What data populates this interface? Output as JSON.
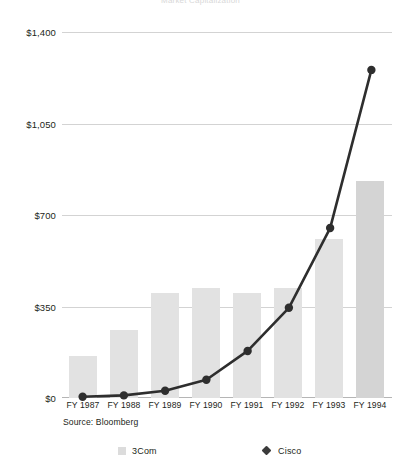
{
  "chart_data": {
    "type": "bar",
    "title": "Market Capitalization",
    "subtitle": "",
    "xlabel": "",
    "ylabel": "",
    "ylim": [
      0,
      1400
    ],
    "yticks": [
      0,
      350,
      700,
      1050,
      1400
    ],
    "ytick_labels": [
      "$0",
      "$350",
      "$700",
      "$1,050",
      "$1,400"
    ],
    "grid": true,
    "legend_position": "bottom",
    "categories": [
      "FY 1987",
      "FY 1988",
      "FY 1989",
      "FY 1990",
      "FY 1991",
      "FY 1992",
      "FY 1993",
      "FY 1994"
    ],
    "series": [
      {
        "name": "3Com",
        "type": "bar",
        "color": "#e2e2e2",
        "values": [
          160,
          260,
          400,
          420,
          400,
          420,
          610,
          830
        ]
      },
      {
        "name": "Cisco",
        "type": "line",
        "color": "#2e2e2e",
        "marker": "diamond",
        "values": [
          5,
          10,
          28,
          70,
          180,
          345,
          650,
          1255
        ]
      }
    ],
    "annotations": [
      "Source: Bloomberg"
    ]
  },
  "axis": {
    "y": {
      "labels": [
        "$1,400",
        "$1,050",
        "$700",
        "$350",
        "$0"
      ],
      "values": [
        1400,
        1050,
        700,
        350,
        0
      ]
    },
    "x": {
      "labels": [
        "FY 1987",
        "FY 1988",
        "FY 1989",
        "FY 1990",
        "FY 1991",
        "FY 1992",
        "FY 1993",
        "FY 1994"
      ]
    }
  },
  "source_note": "Source: Bloomberg",
  "legend": {
    "items": [
      {
        "label": "3Com",
        "marker": "square-swatch",
        "color": "#dcdcdc"
      },
      {
        "label": "Cisco",
        "marker": "diamond-marker",
        "color": "#3b3b3b"
      }
    ]
  },
  "colors": {
    "bar": "#e2e2e2",
    "bar_last": "#d4d4d4",
    "line": "#2e2e2e",
    "grid": "#d3d3d3",
    "baseline": "#b5b5b5",
    "text": "#231f20"
  }
}
